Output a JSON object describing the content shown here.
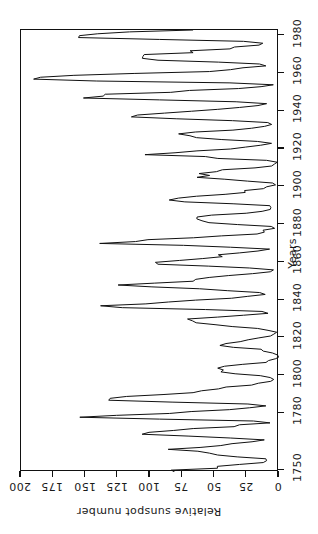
{
  "chart_data": {
    "type": "line",
    "title": "",
    "xlabel": "Years",
    "ylabel": "Relative sunspot number",
    "orientation": "rotated-90ccw",
    "grid": false,
    "legend": "none",
    "xlim": [
      1749,
      1983
    ],
    "ylim": [
      0,
      200
    ],
    "xticks": [
      1750,
      1780,
      1800,
      1820,
      1840,
      1860,
      1880,
      1900,
      1920,
      1940,
      1960,
      1980
    ],
    "xticklabels": [
      "1750",
      "1780",
      "1800",
      "1820",
      "1840",
      "1860",
      "1880",
      "1900",
      "1920",
      "1940",
      "1960",
      "1980"
    ],
    "yticks": [
      0,
      25,
      50,
      75,
      100,
      125,
      150,
      175,
      200
    ],
    "yticklabels": [
      "0",
      "25",
      "50",
      "75",
      "100",
      "125",
      "150",
      "175",
      "200"
    ],
    "line_color": "#111111",
    "line_width": 1.0,
    "series": [
      {
        "name": "Relative sunspot number",
        "x": [
          1749,
          1750,
          1751,
          1752,
          1753,
          1754,
          1755,
          1756,
          1757,
          1758,
          1759,
          1760,
          1761,
          1762,
          1763,
          1764,
          1765,
          1766,
          1767,
          1768,
          1769,
          1770,
          1771,
          1772,
          1773,
          1774,
          1775,
          1776,
          1777,
          1778,
          1779,
          1780,
          1781,
          1782,
          1783,
          1784,
          1785,
          1786,
          1787,
          1788,
          1789,
          1790,
          1791,
          1792,
          1793,
          1794,
          1795,
          1796,
          1797,
          1798,
          1799,
          1800,
          1801,
          1802,
          1803,
          1804,
          1805,
          1806,
          1807,
          1808,
          1809,
          1810,
          1811,
          1812,
          1813,
          1814,
          1815,
          1816,
          1817,
          1818,
          1819,
          1820,
          1821,
          1822,
          1823,
          1824,
          1825,
          1826,
          1827,
          1828,
          1829,
          1830,
          1831,
          1832,
          1833,
          1834,
          1835,
          1836,
          1837,
          1838,
          1839,
          1840,
          1841,
          1842,
          1843,
          1844,
          1845,
          1846,
          1847,
          1848,
          1849,
          1850,
          1851,
          1852,
          1853,
          1854,
          1855,
          1856,
          1857,
          1858,
          1859,
          1860,
          1861,
          1862,
          1863,
          1864,
          1865,
          1866,
          1867,
          1868,
          1869,
          1870,
          1871,
          1872,
          1873,
          1874,
          1875,
          1876,
          1877,
          1878,
          1879,
          1880,
          1881,
          1882,
          1883,
          1884,
          1885,
          1886,
          1887,
          1888,
          1889,
          1890,
          1891,
          1892,
          1893,
          1894,
          1895,
          1896,
          1897,
          1898,
          1899,
          1900,
          1901,
          1902,
          1903,
          1904,
          1905,
          1906,
          1907,
          1908,
          1909,
          1910,
          1911,
          1912,
          1913,
          1914,
          1915,
          1916,
          1917,
          1918,
          1919,
          1920,
          1921,
          1922,
          1923,
          1924,
          1925,
          1926,
          1927,
          1928,
          1929,
          1930,
          1931,
          1932,
          1933,
          1934,
          1935,
          1936,
          1937,
          1938,
          1939,
          1940,
          1941,
          1942,
          1943,
          1944,
          1945,
          1946,
          1947,
          1948,
          1949,
          1950,
          1951,
          1952,
          1953,
          1954,
          1955,
          1956,
          1957,
          1958,
          1959,
          1960,
          1961,
          1962,
          1963,
          1964,
          1965,
          1966,
          1967,
          1968,
          1969,
          1970,
          1971,
          1972,
          1973,
          1974,
          1975,
          1976,
          1977,
          1978,
          1979,
          1980,
          1981,
          1982,
          1983
        ],
        "values": [
          80.9,
          83.4,
          47.7,
          47.8,
          30.7,
          12.2,
          9.6,
          10.2,
          32.4,
          47.6,
          54.0,
          62.9,
          85.9,
          61.2,
          45.1,
          36.4,
          20.9,
          11.4,
          37.8,
          69.8,
          106.1,
          100.8,
          81.6,
          66.5,
          34.8,
          30.6,
          7.0,
          19.8,
          92.5,
          154.4,
          125.9,
          84.8,
          68.1,
          38.5,
          22.8,
          10.2,
          24.1,
          82.9,
          132.0,
          130.9,
          118.1,
          89.9,
          66.6,
          60.0,
          46.9,
          41.0,
          21.3,
          16.0,
          6.4,
          4.1,
          6.8,
          14.5,
          34.0,
          45.0,
          43.1,
          47.5,
          42.2,
          28.1,
          10.1,
          8.1,
          2.5,
          0.0,
          1.4,
          5.0,
          12.2,
          13.9,
          35.4,
          45.8,
          41.1,
          30.1,
          23.9,
          15.6,
          6.6,
          4.0,
          1.8,
          8.5,
          16.6,
          36.3,
          49.6,
          64.2,
          67.0,
          70.9,
          47.8,
          27.5,
          8.5,
          13.2,
          56.9,
          121.5,
          138.3,
          103.2,
          85.7,
          64.6,
          36.7,
          24.2,
          10.7,
          15.0,
          40.1,
          61.5,
          98.5,
          124.7,
          96.3,
          66.6,
          64.5,
          54.1,
          39.0,
          20.6,
          6.7,
          4.3,
          22.7,
          54.8,
          93.8,
          95.8,
          77.2,
          59.1,
          44.0,
          47.0,
          30.5,
          16.3,
          7.3,
          37.6,
          74.0,
          139.0,
          111.2,
          101.6,
          66.2,
          44.7,
          17.0,
          11.3,
          12.4,
          3.4,
          6.0,
          32.3,
          54.3,
          59.7,
          63.7,
          63.5,
          52.2,
          25.4,
          13.1,
          6.8,
          6.3,
          7.1,
          35.6,
          73.0,
          85.1,
          78.0,
          64.0,
          41.8,
          26.2,
          26.7,
          12.1,
          9.5,
          2.7,
          5.0,
          24.4,
          42.0,
          63.5,
          53.8,
          62.0,
          48.5,
          43.9,
          18.6,
          5.7,
          3.6,
          1.4,
          9.6,
          47.4,
          57.1,
          103.9,
          80.6,
          63.6,
          37.6,
          26.1,
          14.2,
          5.8,
          16.7,
          44.3,
          63.9,
          69.0,
          77.8,
          64.9,
          35.7,
          21.2,
          11.1,
          5.7,
          8.7,
          36.1,
          79.7,
          114.4,
          109.6,
          88.8,
          67.8,
          47.5,
          30.6,
          16.3,
          9.6,
          33.2,
          92.6,
          151.6,
          136.3,
          134.7,
          83.9,
          69.4,
          31.5,
          13.9,
          4.4,
          38.0,
          141.7,
          190.2,
          184.8,
          159.0,
          112.3,
          53.9,
          37.6,
          27.9,
          10.2,
          15.1,
          47.0,
          93.8,
          105.9,
          105.5,
          104.5,
          66.6,
          68.9,
          38.0,
          34.5,
          15.5,
          12.6,
          27.5,
          92.5,
          155.4,
          154.7,
          140.5,
          115.9,
          66.6
        ]
      }
    ],
    "annotations": []
  },
  "axes": {
    "value_axis": {
      "title": "Relative sunspot number",
      "ticks": [
        {
          "value": 200,
          "label": "200"
        },
        {
          "value": 175,
          "label": "175"
        },
        {
          "value": 150,
          "label": "150"
        },
        {
          "value": 125,
          "label": "125"
        },
        {
          "value": 100,
          "label": "100"
        },
        {
          "value": 75,
          "label": "75"
        },
        {
          "value": 50,
          "label": "50"
        },
        {
          "value": 25,
          "label": "25"
        },
        {
          "value": 0,
          "label": "0"
        }
      ]
    },
    "time_axis": {
      "title": "Years",
      "ticks": [
        {
          "value": 1750,
          "label": "1750"
        },
        {
          "value": 1780,
          "label": "1780"
        },
        {
          "value": 1800,
          "label": "1800"
        },
        {
          "value": 1820,
          "label": "1820"
        },
        {
          "value": 1840,
          "label": "1840"
        },
        {
          "value": 1860,
          "label": "1860"
        },
        {
          "value": 1880,
          "label": "1880"
        },
        {
          "value": 1900,
          "label": "1900"
        },
        {
          "value": 1920,
          "label": "1920"
        },
        {
          "value": 1940,
          "label": "1940"
        },
        {
          "value": 1960,
          "label": "1960"
        },
        {
          "value": 1980,
          "label": "1980"
        }
      ]
    }
  }
}
